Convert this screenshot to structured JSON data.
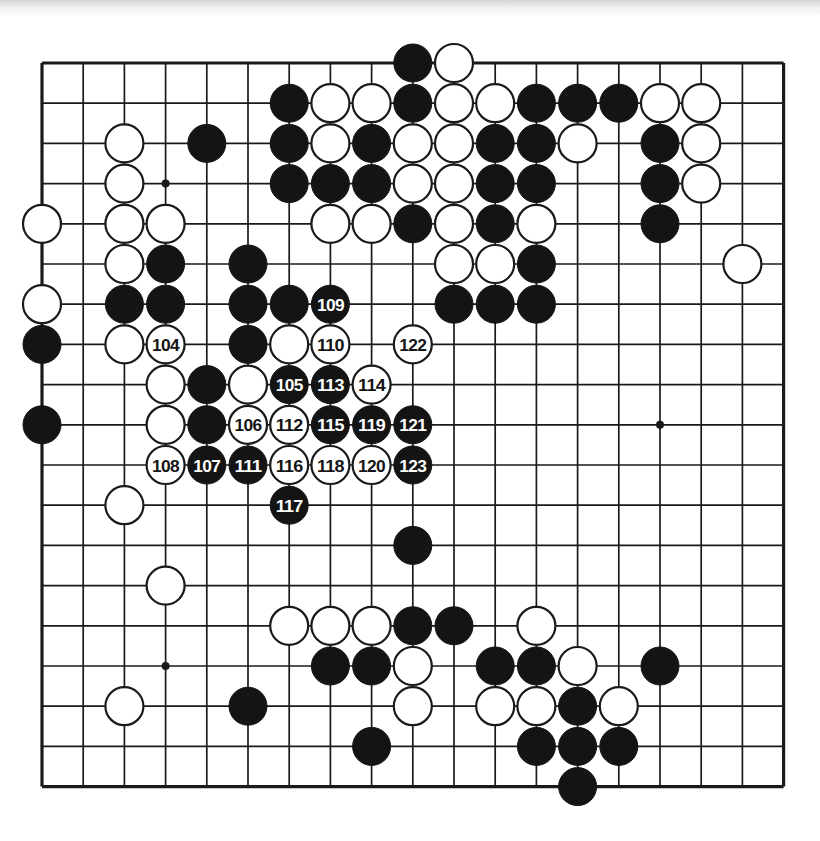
{
  "diagram": {
    "kind": "go-board-diagram",
    "board_size": 19,
    "move_range": "104-123",
    "colors": {
      "background": "#ffffff",
      "line": "#1a1a1a",
      "black_stone": "#141414",
      "white_stone": "#ffffff",
      "white_stone_border": "#1a1a1a",
      "label_on_black": "#ffffff",
      "label_on_white": "#141414",
      "scan_strip": "#d2d2d2"
    },
    "geometry": {
      "origin_x": 42,
      "origin_y": 63,
      "step_x": 41.2,
      "step_y": 40.2,
      "stone_radius": 19,
      "board_left": 42,
      "board_top": 63,
      "board_right": 783,
      "board_bottom": 787
    },
    "star_points": [
      {
        "c": 4,
        "r": 4
      },
      {
        "c": 10,
        "r": 4
      },
      {
        "c": 16,
        "r": 4
      },
      {
        "c": 4,
        "r": 10
      },
      {
        "c": 10,
        "r": 10
      },
      {
        "c": 16,
        "r": 10
      },
      {
        "c": 4,
        "r": 16
      },
      {
        "c": 10,
        "r": 16
      },
      {
        "c": 16,
        "r": 16
      }
    ],
    "stones": [
      {
        "c": 10,
        "r": 1,
        "color": "black"
      },
      {
        "c": 11,
        "r": 1,
        "color": "white"
      },
      {
        "c": 7,
        "r": 2,
        "color": "black"
      },
      {
        "c": 8,
        "r": 2,
        "color": "white"
      },
      {
        "c": 9,
        "r": 2,
        "color": "white"
      },
      {
        "c": 10,
        "r": 2,
        "color": "black"
      },
      {
        "c": 11,
        "r": 2,
        "color": "white"
      },
      {
        "c": 12,
        "r": 2,
        "color": "white"
      },
      {
        "c": 13,
        "r": 2,
        "color": "black"
      },
      {
        "c": 14,
        "r": 2,
        "color": "black"
      },
      {
        "c": 15,
        "r": 2,
        "color": "black"
      },
      {
        "c": 16,
        "r": 2,
        "color": "white"
      },
      {
        "c": 17,
        "r": 2,
        "color": "white"
      },
      {
        "c": 3,
        "r": 3,
        "color": "white"
      },
      {
        "c": 5,
        "r": 3,
        "color": "black"
      },
      {
        "c": 7,
        "r": 3,
        "color": "black"
      },
      {
        "c": 8,
        "r": 3,
        "color": "white"
      },
      {
        "c": 9,
        "r": 3,
        "color": "black"
      },
      {
        "c": 10,
        "r": 3,
        "color": "white"
      },
      {
        "c": 11,
        "r": 3,
        "color": "white"
      },
      {
        "c": 12,
        "r": 3,
        "color": "black"
      },
      {
        "c": 13,
        "r": 3,
        "color": "black"
      },
      {
        "c": 14,
        "r": 3,
        "color": "white"
      },
      {
        "c": 16,
        "r": 3,
        "color": "black"
      },
      {
        "c": 17,
        "r": 3,
        "color": "white"
      },
      {
        "c": 3,
        "r": 4,
        "color": "white"
      },
      {
        "c": 7,
        "r": 4,
        "color": "black"
      },
      {
        "c": 8,
        "r": 4,
        "color": "black"
      },
      {
        "c": 9,
        "r": 4,
        "color": "black"
      },
      {
        "c": 10,
        "r": 4,
        "color": "white"
      },
      {
        "c": 11,
        "r": 4,
        "color": "white"
      },
      {
        "c": 12,
        "r": 4,
        "color": "black"
      },
      {
        "c": 13,
        "r": 4,
        "color": "black"
      },
      {
        "c": 16,
        "r": 4,
        "color": "black"
      },
      {
        "c": 17,
        "r": 4,
        "color": "white"
      },
      {
        "c": 1,
        "r": 5,
        "color": "white"
      },
      {
        "c": 3,
        "r": 5,
        "color": "white"
      },
      {
        "c": 4,
        "r": 5,
        "color": "white"
      },
      {
        "c": 8,
        "r": 5,
        "color": "white"
      },
      {
        "c": 9,
        "r": 5,
        "color": "white"
      },
      {
        "c": 10,
        "r": 5,
        "color": "black"
      },
      {
        "c": 11,
        "r": 5,
        "color": "white"
      },
      {
        "c": 12,
        "r": 5,
        "color": "black"
      },
      {
        "c": 13,
        "r": 5,
        "color": "white"
      },
      {
        "c": 16,
        "r": 5,
        "color": "black"
      },
      {
        "c": 3,
        "r": 6,
        "color": "white"
      },
      {
        "c": 4,
        "r": 6,
        "color": "black"
      },
      {
        "c": 6,
        "r": 6,
        "color": "black"
      },
      {
        "c": 11,
        "r": 6,
        "color": "white"
      },
      {
        "c": 12,
        "r": 6,
        "color": "white"
      },
      {
        "c": 13,
        "r": 6,
        "color": "black"
      },
      {
        "c": 18,
        "r": 6,
        "color": "white"
      },
      {
        "c": 1,
        "r": 7,
        "color": "white"
      },
      {
        "c": 3,
        "r": 7,
        "color": "black"
      },
      {
        "c": 4,
        "r": 7,
        "color": "black"
      },
      {
        "c": 6,
        "r": 7,
        "color": "black"
      },
      {
        "c": 7,
        "r": 7,
        "color": "black"
      },
      {
        "c": 11,
        "r": 7,
        "color": "black"
      },
      {
        "c": 12,
        "r": 7,
        "color": "black"
      },
      {
        "c": 13,
        "r": 7,
        "color": "black"
      },
      {
        "c": 1,
        "r": 8,
        "color": "black"
      },
      {
        "c": 3,
        "r": 8,
        "color": "white"
      },
      {
        "c": 6,
        "r": 8,
        "color": "black"
      },
      {
        "c": 7,
        "r": 8,
        "color": "white"
      },
      {
        "c": 10,
        "r": 8,
        "color": "black"
      },
      {
        "c": 4,
        "r": 9,
        "color": "white"
      },
      {
        "c": 5,
        "r": 9,
        "color": "black"
      },
      {
        "c": 6,
        "r": 9,
        "color": "white"
      },
      {
        "c": 1,
        "r": 10,
        "color": "black"
      },
      {
        "c": 4,
        "r": 10,
        "color": "white"
      },
      {
        "c": 5,
        "r": 10,
        "color": "black"
      },
      {
        "c": 10,
        "r": 13,
        "color": "black"
      },
      {
        "c": 3,
        "r": 12,
        "color": "white"
      },
      {
        "c": 4,
        "r": 14,
        "color": "white"
      },
      {
        "c": 7,
        "r": 15,
        "color": "white"
      },
      {
        "c": 8,
        "r": 15,
        "color": "white"
      },
      {
        "c": 9,
        "r": 15,
        "color": "white"
      },
      {
        "c": 10,
        "r": 15,
        "color": "black"
      },
      {
        "c": 11,
        "r": 15,
        "color": "black"
      },
      {
        "c": 13,
        "r": 15,
        "color": "white"
      },
      {
        "c": 8,
        "r": 16,
        "color": "black"
      },
      {
        "c": 9,
        "r": 16,
        "color": "black"
      },
      {
        "c": 10,
        "r": 16,
        "color": "white"
      },
      {
        "c": 12,
        "r": 16,
        "color": "black"
      },
      {
        "c": 13,
        "r": 16,
        "color": "black"
      },
      {
        "c": 14,
        "r": 16,
        "color": "white"
      },
      {
        "c": 16,
        "r": 16,
        "color": "black"
      },
      {
        "c": 3,
        "r": 17,
        "color": "white"
      },
      {
        "c": 6,
        "r": 17,
        "color": "black"
      },
      {
        "c": 10,
        "r": 17,
        "color": "white"
      },
      {
        "c": 12,
        "r": 17,
        "color": "white"
      },
      {
        "c": 13,
        "r": 17,
        "color": "white"
      },
      {
        "c": 14,
        "r": 17,
        "color": "black"
      },
      {
        "c": 15,
        "r": 17,
        "color": "white"
      },
      {
        "c": 9,
        "r": 18,
        "color": "black"
      },
      {
        "c": 13,
        "r": 18,
        "color": "black"
      },
      {
        "c": 14,
        "r": 18,
        "color": "black"
      },
      {
        "c": 15,
        "r": 18,
        "color": "black"
      },
      {
        "c": 14,
        "r": 19,
        "color": "black"
      }
    ],
    "numbered_moves": [
      {
        "n": "104",
        "c": 4,
        "r": 8,
        "color": "white"
      },
      {
        "n": "105",
        "c": 7,
        "r": 9,
        "color": "black"
      },
      {
        "n": "106",
        "c": 6,
        "r": 10,
        "color": "white"
      },
      {
        "n": "107",
        "c": 5,
        "r": 11,
        "color": "black"
      },
      {
        "n": "108",
        "c": 4,
        "r": 11,
        "color": "white"
      },
      {
        "n": "109",
        "c": 8,
        "r": 7,
        "color": "black"
      },
      {
        "n": "110",
        "c": 8,
        "r": 8,
        "color": "white"
      },
      {
        "n": "111",
        "c": 6,
        "r": 11,
        "color": "black"
      },
      {
        "n": "112",
        "c": 7,
        "r": 10,
        "color": "white"
      },
      {
        "n": "113",
        "c": 8,
        "r": 9,
        "color": "black"
      },
      {
        "n": "114",
        "c": 9,
        "r": 9,
        "color": "white"
      },
      {
        "n": "115",
        "c": 8,
        "r": 10,
        "color": "black"
      },
      {
        "n": "116",
        "c": 7,
        "r": 11,
        "color": "white"
      },
      {
        "n": "117",
        "c": 7,
        "r": 12,
        "color": "black"
      },
      {
        "n": "118",
        "c": 8,
        "r": 11,
        "color": "white"
      },
      {
        "n": "119",
        "c": 9,
        "r": 10,
        "color": "black"
      },
      {
        "n": "120",
        "c": 9,
        "r": 11,
        "color": "white"
      },
      {
        "n": "121",
        "c": 10,
        "r": 10,
        "color": "black"
      },
      {
        "n": "122",
        "c": 10,
        "r": 8,
        "color": "white"
      },
      {
        "n": "123",
        "c": 10,
        "r": 11,
        "color": "black"
      }
    ]
  }
}
